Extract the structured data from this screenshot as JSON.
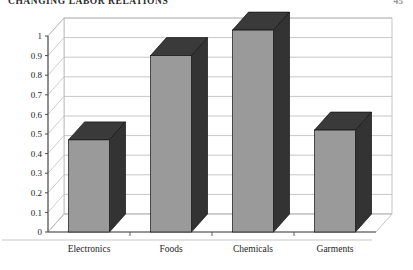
{
  "page": {
    "running_head": "CHANGING LABOR RELATIONS",
    "folio": "45"
  },
  "chart_data": {
    "type": "bar",
    "title": "",
    "subtitle": "",
    "xlabel": "",
    "ylabel": "",
    "categories": [
      "Electronics",
      "Foods",
      "Chemicals",
      "Garments"
    ],
    "values": [
      0.47,
      0.9,
      1.03,
      0.52
    ],
    "ylim": [
      0,
      1
    ],
    "ytick_labels": [
      "0",
      "0.1",
      "0.2",
      "0.3",
      "0.4",
      "0.5",
      "0.6",
      "0.7",
      "0.8",
      "0.9",
      "1"
    ],
    "ytick_values": [
      0,
      0.1,
      0.2,
      0.3,
      0.4,
      0.5,
      0.6,
      0.7,
      0.8,
      0.9,
      1
    ],
    "grid": true,
    "legend": false,
    "legend_position": "none",
    "style": "3d-column",
    "colors": {
      "bar_front": "#9a9a9a",
      "bar_side": "#333333",
      "bar_top": "#3a3a3a",
      "grid_line": "#b9b9b9",
      "axis_line": "#4a4a4a",
      "wall": "#ffffff",
      "floor": "#ffffff",
      "text": "#1d1d1d"
    }
  }
}
